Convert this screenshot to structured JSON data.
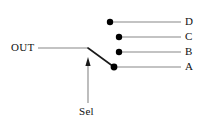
{
  "diagram": {
    "type": "schematic",
    "background_color": "#ffffff",
    "line_color": "#888888",
    "arm_color": "#1a1a1a",
    "dot_color": "#000000",
    "text_color": "#111111",
    "canvas": {
      "width": 204,
      "height": 128
    }
  },
  "output": {
    "label": "OUT",
    "label_x": 11,
    "label_y": 42,
    "wire": {
      "x1": 38,
      "y1": 48,
      "x2": 88,
      "y2": 48
    }
  },
  "selector": {
    "label": "Sel",
    "label_x": 79,
    "label_y": 106,
    "arrow": {
      "x": 88,
      "y_tip": 57,
      "y_tail": 103
    },
    "arm": {
      "x1": 88,
      "y1": 48,
      "x2": 114,
      "y2": 67
    },
    "connected_contact": "A"
  },
  "contacts": [
    {
      "label": "D",
      "dot": {
        "cx": 110,
        "cy": 22,
        "r": 3.2
      },
      "wire": {
        "x1": 110,
        "y1": 22,
        "x2": 181,
        "y2": 22
      },
      "label_x": 185,
      "label_y": 16
    },
    {
      "label": "C",
      "dot": {
        "cx": 119,
        "cy": 37,
        "r": 3.2
      },
      "wire": {
        "x1": 119,
        "y1": 37,
        "x2": 181,
        "y2": 37
      },
      "label_x": 185,
      "label_y": 31
    },
    {
      "label": "B",
      "dot": {
        "cx": 119,
        "cy": 52,
        "r": 3.2
      },
      "wire": {
        "x1": 119,
        "y1": 52,
        "x2": 181,
        "y2": 52
      },
      "label_x": 185,
      "label_y": 46
    },
    {
      "label": "A",
      "dot": {
        "cx": 114,
        "cy": 67,
        "r": 3.4
      },
      "wire": {
        "x1": 114,
        "y1": 67,
        "x2": 181,
        "y2": 67
      },
      "label_x": 185,
      "label_y": 61
    }
  ]
}
